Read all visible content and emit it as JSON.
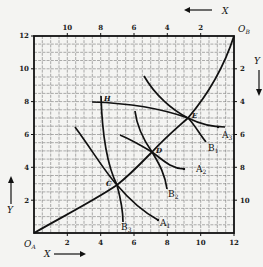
{
  "diagram": {
    "type": "edgeworth-box",
    "origins": {
      "a": "O",
      "a_sub": "A",
      "b": "O",
      "b_sub": "B"
    },
    "axis_labels": {
      "x_bottom": "X",
      "y_left": "Y",
      "x_top": "X",
      "y_right": "Y"
    },
    "bottom_ticks": [
      "2",
      "4",
      "6",
      "8",
      "10",
      "12"
    ],
    "left_ticks": [
      "2",
      "4",
      "6",
      "8",
      "10",
      "12"
    ],
    "top_ticks": [
      "10",
      "8",
      "6",
      "4",
      "2"
    ],
    "right_ticks": [
      "2",
      "4",
      "6",
      "8",
      "10"
    ],
    "points": [
      {
        "label": "C",
        "x": 5,
        "y": 3
      },
      {
        "label": "D",
        "x": 7,
        "y": 5
      },
      {
        "label": "E",
        "x": 9.2,
        "y": 7
      },
      {
        "label": "H",
        "x": 4,
        "y": 8
      }
    ],
    "curves": [
      {
        "label": "A",
        "sub": "1",
        "kind": "indifference-A"
      },
      {
        "label": "A",
        "sub": "2",
        "kind": "indifference-A"
      },
      {
        "label": "A",
        "sub": "3",
        "kind": "indifference-A"
      },
      {
        "label": "B",
        "sub": "1",
        "kind": "indifference-B"
      },
      {
        "label": "B",
        "sub": "2",
        "kind": "indifference-B"
      },
      {
        "label": "B",
        "sub": "3",
        "kind": "indifference-B"
      }
    ],
    "contract_curve": "O_A to O_B through C, D, E",
    "box": {
      "x_max": 12,
      "y_max": 12
    }
  }
}
